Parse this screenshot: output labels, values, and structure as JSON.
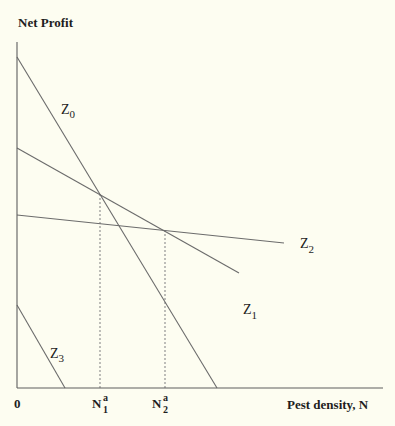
{
  "figure": {
    "y_axis_label": "Net Profit",
    "x_axis_label": "Pest density, N",
    "origin_label": "0",
    "markers": [
      {
        "base": "N",
        "sup": "a",
        "sub": "1"
      },
      {
        "base": "N",
        "sup": "a",
        "sub": "2"
      }
    ],
    "curve_labels": [
      {
        "base": "Z",
        "sub": "0"
      },
      {
        "base": "Z",
        "sub": "1"
      },
      {
        "base": "Z",
        "sub": "2"
      },
      {
        "base": "Z",
        "sub": "3"
      }
    ]
  },
  "colors": {
    "background": "#fdfdf1",
    "axis": "#5e5e5e",
    "curve": "#6b6b6b",
    "reference": "#8a8a8a",
    "text": "#1e1e1e"
  },
  "chart_data": {
    "type": "line",
    "title": "",
    "xlabel": "Pest density, N",
    "ylabel": "Net Profit",
    "xlim": [
      0,
      366
    ],
    "ylim": [
      0,
      346
    ],
    "grid": false,
    "legend": "none (curves labelled inline)",
    "units_note": "conceptual diagram without numeric ticks; coordinates are relative plot units",
    "x_tick_labels": [
      "0",
      "N1a",
      "N2a"
    ],
    "series": [
      {
        "name": "Z0",
        "points": [
          [
            0,
            331
          ],
          [
            200,
            0
          ]
        ]
      },
      {
        "name": "Z1",
        "points": [
          [
            0,
            240
          ],
          [
            222,
            115
          ]
        ]
      },
      {
        "name": "Z2",
        "points": [
          [
            0,
            173
          ],
          [
            267,
            145
          ]
        ]
      },
      {
        "name": "Z3",
        "points": [
          [
            0,
            83
          ],
          [
            48,
            0
          ]
        ]
      }
    ],
    "reference_lines": [
      {
        "name": "N1a",
        "style": "dashed",
        "x": 83,
        "y_top": 194,
        "note": "Z0 and Z1 intersect"
      },
      {
        "name": "N2a",
        "style": "dashed",
        "x": 148,
        "y_top": 157,
        "note": "Z1 and Z2 intersect"
      }
    ],
    "annotations": [
      {
        "text": "Z0",
        "x": 44,
        "y": 274
      },
      {
        "text": "Z1",
        "x": 226,
        "y": 74
      },
      {
        "text": "Z2",
        "x": 283,
        "y": 140
      },
      {
        "text": "Z3",
        "x": 33,
        "y": 30
      }
    ]
  }
}
